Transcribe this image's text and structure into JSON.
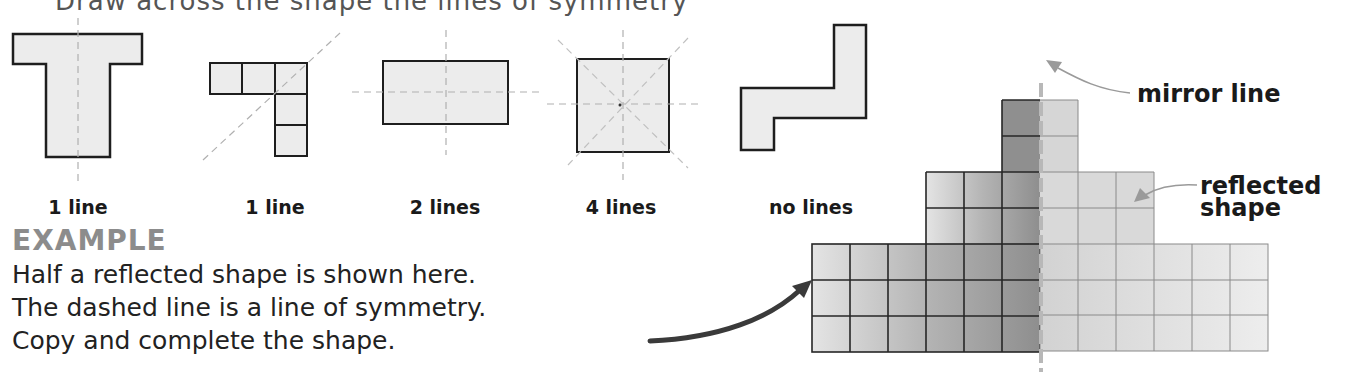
{
  "header": {
    "cut_off_text": "Draw across the shape the lines of symmetry"
  },
  "examples": [
    {
      "shape": "T-shape",
      "label": "1 line"
    },
    {
      "shape": "L-tromino-of-five-squares",
      "label": "1 line"
    },
    {
      "shape": "rectangle",
      "label": "2 lines"
    },
    {
      "shape": "square",
      "label": "4 lines"
    },
    {
      "shape": "S-shape",
      "label": "no lines"
    }
  ],
  "example_section": {
    "heading": "EXAMPLE",
    "lines": [
      "Half a reflected shape is shown here.",
      "The dashed line is a line of symmetry.",
      "Copy and complete the shape."
    ]
  },
  "diagram": {
    "callouts": {
      "mirror_line": "mirror line",
      "reflected_shape_line1": "reflected",
      "reflected_shape_line2": "shape"
    },
    "colors": {
      "original_dark": "#8f8f8f",
      "original_light": "#e0e0e0",
      "reflected": "#dedede",
      "mirror_line": "#b8b8b8",
      "shape_fill": "#ececec",
      "outline": "#1e1e1e",
      "guide_line": "#b0b0b0"
    }
  }
}
